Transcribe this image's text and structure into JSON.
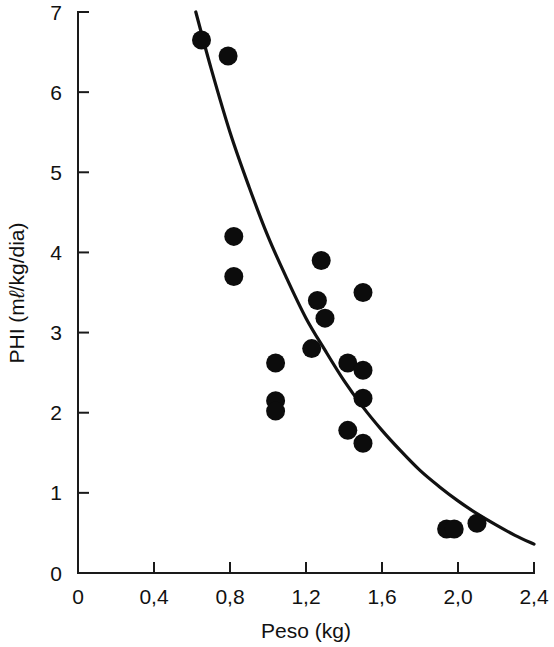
{
  "chart_data": {
    "type": "scatter",
    "title": "",
    "xlabel": "Peso (kg)",
    "ylabel": "PHI (mℓ/kg/dia)",
    "ylabel_parts": {
      "prefix": "PHI (m",
      "liter_symbol": "ℓ",
      "suffix": "/kg/dia)"
    },
    "xlim": [
      0,
      2.4
    ],
    "ylim": [
      0,
      7
    ],
    "xticks": [
      0,
      0.4,
      0.8,
      1.2,
      1.6,
      2.0,
      2.4
    ],
    "xtick_labels": [
      "0",
      "0,4",
      "0,8",
      "1,2",
      "1,6",
      "2,0",
      "2,4"
    ],
    "yticks": [
      0,
      1,
      2,
      3,
      4,
      5,
      6,
      7
    ],
    "ytick_labels": [
      "0",
      "1",
      "2",
      "3",
      "4",
      "5",
      "6",
      "7"
    ],
    "grid": false,
    "legend": null,
    "decimal_separator": ",",
    "marker": {
      "shape": "circle",
      "color": "#0c0c0c",
      "radius_px": 9.5
    },
    "points": [
      {
        "x": 0.65,
        "y": 6.65
      },
      {
        "x": 0.79,
        "y": 6.45
      },
      {
        "x": 0.82,
        "y": 4.2
      },
      {
        "x": 0.82,
        "y": 3.7
      },
      {
        "x": 1.04,
        "y": 2.62
      },
      {
        "x": 1.04,
        "y": 2.15
      },
      {
        "x": 1.04,
        "y": 2.02
      },
      {
        "x": 1.28,
        "y": 3.9
      },
      {
        "x": 1.26,
        "y": 3.4
      },
      {
        "x": 1.3,
        "y": 3.18
      },
      {
        "x": 1.23,
        "y": 2.8
      },
      {
        "x": 1.42,
        "y": 2.62
      },
      {
        "x": 1.5,
        "y": 3.5
      },
      {
        "x": 1.5,
        "y": 2.53
      },
      {
        "x": 1.5,
        "y": 2.18
      },
      {
        "x": 1.42,
        "y": 1.78
      },
      {
        "x": 1.5,
        "y": 1.62
      },
      {
        "x": 1.94,
        "y": 0.55
      },
      {
        "x": 1.98,
        "y": 0.55
      },
      {
        "x": 2.1,
        "y": 0.62
      }
    ],
    "fit_curve": {
      "label": "fitted exponential decay curve",
      "style": "solid",
      "color": "#111111",
      "x_start": 0.62,
      "x_end": 2.4,
      "y_start": 7.0,
      "y_end": 0.36,
      "samples": [
        {
          "x": 0.62,
          "y": 7.0
        },
        {
          "x": 0.7,
          "y": 6.3
        },
        {
          "x": 0.8,
          "y": 5.5
        },
        {
          "x": 0.9,
          "y": 4.82
        },
        {
          "x": 1.0,
          "y": 4.2
        },
        {
          "x": 1.1,
          "y": 3.67
        },
        {
          "x": 1.2,
          "y": 3.18
        },
        {
          "x": 1.3,
          "y": 2.78
        },
        {
          "x": 1.4,
          "y": 2.4
        },
        {
          "x": 1.5,
          "y": 2.07
        },
        {
          "x": 1.6,
          "y": 1.78
        },
        {
          "x": 1.7,
          "y": 1.52
        },
        {
          "x": 1.8,
          "y": 1.28
        },
        {
          "x": 1.9,
          "y": 1.08
        },
        {
          "x": 2.0,
          "y": 0.9
        },
        {
          "x": 2.1,
          "y": 0.74
        },
        {
          "x": 2.2,
          "y": 0.6
        },
        {
          "x": 2.3,
          "y": 0.47
        },
        {
          "x": 2.4,
          "y": 0.36
        }
      ]
    }
  },
  "plot_geometry": {
    "left_px": 78,
    "right_px": 534,
    "top_px": 12,
    "bottom_px": 573
  }
}
